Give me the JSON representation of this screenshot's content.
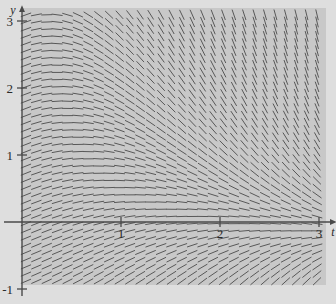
{
  "figure": {
    "kind": "slope-field",
    "background_outer": "#dedede",
    "background_plot": "#c8c8c8",
    "axis_color": "#4a4a4a",
    "segment_color": "#585858"
  },
  "axes": {
    "x_axis_label": "t",
    "y_axis_label": "y",
    "x_ticks": [
      "1",
      "2",
      "3"
    ],
    "x_tick_values": [
      1,
      2,
      3
    ],
    "y_ticks": [
      "3",
      "2",
      "1",
      "-1"
    ],
    "y_tick_values": [
      3,
      2,
      1,
      -1
    ],
    "xlim": [
      0,
      3.15
    ],
    "ylim": [
      -1.15,
      3.35
    ]
  },
  "chart_data": {
    "type": "scatter",
    "title": "",
    "xlabel": "t",
    "ylabel": "y",
    "xlim": [
      0,
      3.15
    ],
    "ylim": [
      -1.15,
      3.35
    ],
    "grid": false,
    "legend": "none",
    "plot_box": {
      "x0": 22,
      "y0": 8,
      "x1": 326,
      "y1": 285
    },
    "axis_origin_px": {
      "x": 22,
      "y": 222
    },
    "px_per_unit": {
      "x": 99.0,
      "y": 67.0
    },
    "field": {
      "description": "Direction field of a first-order ODE y' = f(t,y); slopes are near-zero along the upper-left and along a nullcline that sweeps down-right, positive below-left of it and increasingly negative above-right of it.",
      "t_start": 0.04,
      "t_step": 0.105,
      "t_count": 30,
      "y_start": -1.1,
      "y_step": 0.1075,
      "y_count": 42,
      "segment_length_px": 11,
      "slope_formula": "dy/dt = -(t*y)/1.55 + (0.62 - 0.30*t)",
      "sample_slopes": [
        {
          "t": 0.1,
          "y": 3.0,
          "slope": 0.4
        },
        {
          "t": 0.1,
          "y": 2.0,
          "slope": 0.46
        },
        {
          "t": 0.1,
          "y": 1.0,
          "slope": 0.52
        },
        {
          "t": 0.1,
          "y": 0.0,
          "slope": 0.59
        },
        {
          "t": 0.1,
          "y": -1.0,
          "slope": 0.65
        },
        {
          "t": 1.0,
          "y": 3.0,
          "slope": -1.61
        },
        {
          "t": 1.0,
          "y": 2.0,
          "slope": -0.97
        },
        {
          "t": 1.0,
          "y": 1.0,
          "slope": -0.33
        },
        {
          "t": 1.0,
          "y": 0.0,
          "slope": 0.32
        },
        {
          "t": 1.0,
          "y": -1.0,
          "slope": 0.96
        },
        {
          "t": 2.0,
          "y": 3.0,
          "slope": -3.85
        },
        {
          "t": 2.0,
          "y": 2.0,
          "slope": -2.56
        },
        {
          "t": 2.0,
          "y": 1.0,
          "slope": -1.27
        },
        {
          "t": 2.0,
          "y": 0.0,
          "slope": 0.02
        },
        {
          "t": 2.0,
          "y": -1.0,
          "slope": 1.31
        },
        {
          "t": 3.0,
          "y": 3.0,
          "slope": -6.09
        },
        {
          "t": 3.0,
          "y": 2.0,
          "slope": -4.15
        },
        {
          "t": 3.0,
          "y": 1.0,
          "slope": -2.21
        },
        {
          "t": 3.0,
          "y": 0.0,
          "slope": -0.28
        },
        {
          "t": 3.0,
          "y": -1.0,
          "slope": 1.66
        }
      ]
    }
  }
}
